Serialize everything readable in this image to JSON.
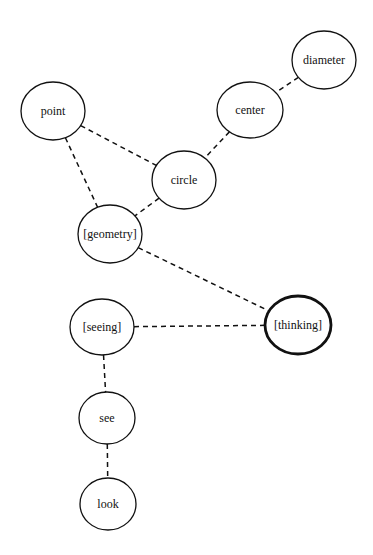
{
  "diagram": {
    "type": "concept-network",
    "nodes": [
      {
        "id": "diameter",
        "label": "diameter",
        "cx": 324,
        "cy": 60,
        "rx": 32,
        "ry": 29,
        "focus": false
      },
      {
        "id": "center",
        "label": "center",
        "cx": 250,
        "cy": 110,
        "rx": 33,
        "ry": 28,
        "focus": false
      },
      {
        "id": "point",
        "label": "point",
        "cx": 53,
        "cy": 111,
        "rx": 32,
        "ry": 29,
        "focus": false
      },
      {
        "id": "circle",
        "label": "circle",
        "cx": 184,
        "cy": 180,
        "rx": 32,
        "ry": 29,
        "focus": false
      },
      {
        "id": "geometry",
        "label": "[geometry]",
        "cx": 110,
        "cy": 234,
        "rx": 32,
        "ry": 29,
        "focus": false
      },
      {
        "id": "thinking",
        "label": "[thinking]",
        "cx": 298,
        "cy": 325,
        "rx": 33,
        "ry": 29,
        "focus": true
      },
      {
        "id": "seeing",
        "label": "[seeing]",
        "cx": 102,
        "cy": 327,
        "rx": 32,
        "ry": 28,
        "focus": false
      },
      {
        "id": "see",
        "label": "see",
        "cx": 107,
        "cy": 418,
        "rx": 28,
        "ry": 26,
        "focus": false
      },
      {
        "id": "look",
        "label": "look",
        "cx": 108,
        "cy": 504,
        "rx": 28,
        "ry": 26,
        "focus": false
      }
    ],
    "edges": [
      {
        "from": "diameter",
        "to": "center",
        "style": "dashed"
      },
      {
        "from": "center",
        "to": "circle",
        "style": "dashed"
      },
      {
        "from": "point",
        "to": "circle",
        "style": "dashed"
      },
      {
        "from": "point",
        "to": "geometry",
        "style": "dashed"
      },
      {
        "from": "circle",
        "to": "geometry",
        "style": "dashed"
      },
      {
        "from": "geometry",
        "to": "thinking",
        "style": "dashed"
      },
      {
        "from": "seeing",
        "to": "thinking",
        "style": "dashed"
      },
      {
        "from": "seeing",
        "to": "see",
        "style": "dashed"
      },
      {
        "from": "see",
        "to": "look",
        "style": "dashed"
      }
    ],
    "colors": {
      "stroke": "#111111",
      "fill": "#ffffff",
      "background": "#ffffff"
    }
  }
}
